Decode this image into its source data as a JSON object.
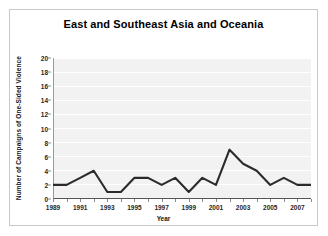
{
  "chart_data": {
    "type": "line",
    "title": "East and Southeast Asia and Oceania",
    "xlabel": "Year",
    "ylabel": "Number of Campaigns of One-Sided Violence",
    "x": [
      1989,
      1990,
      1991,
      1992,
      1993,
      1994,
      1995,
      1996,
      1997,
      1998,
      1999,
      2000,
      2001,
      2002,
      2003,
      2004,
      2005,
      2006,
      2007,
      2008
    ],
    "values": [
      2,
      2,
      3,
      4,
      1,
      1,
      3,
      3,
      2,
      3,
      1,
      3,
      2,
      7,
      5,
      4,
      2,
      3,
      2,
      2
    ],
    "series": [
      {
        "name": "Campaigns of One-Sided Violence",
        "values": [
          2,
          2,
          3,
          4,
          1,
          1,
          3,
          3,
          2,
          3,
          1,
          3,
          2,
          7,
          5,
          4,
          2,
          3,
          2,
          2
        ]
      }
    ],
    "ylim": [
      0,
      20
    ],
    "ytick_labels": [
      "0",
      "2",
      "4",
      "6",
      "8",
      "10",
      "12",
      "14",
      "16",
      "18",
      "20"
    ],
    "ytick_values": [
      0,
      2,
      4,
      6,
      8,
      10,
      12,
      14,
      16,
      18,
      20
    ],
    "xlim": [
      1989,
      2008
    ],
    "xtick_labels": [
      "1989",
      "1991",
      "1993",
      "1995",
      "1997",
      "1999",
      "2001",
      "2003",
      "2005",
      "2007"
    ],
    "xtick_values": [
      1989,
      1991,
      1993,
      1995,
      1997,
      1999,
      2001,
      2003,
      2005,
      2007
    ],
    "grid": "horizontal",
    "legend": "none",
    "line_color": "#2b2b2b",
    "plot_background": "#f2f2f2",
    "gridline_color": "#ffffff"
  }
}
